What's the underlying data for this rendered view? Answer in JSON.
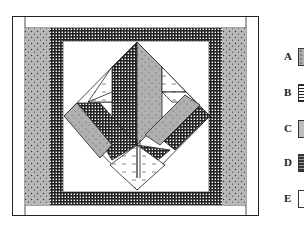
{
  "figure": {
    "legend": [
      {
        "label": "A",
        "fabric": "gray dotted"
      },
      {
        "label": "B",
        "fabric": "dark crosshatch"
      },
      {
        "label": "C",
        "fabric": "light gray speckled"
      },
      {
        "label": "D",
        "fabric": "dark horizontal stripes"
      },
      {
        "label": "E",
        "fabric": "white with dashes"
      }
    ]
  },
  "colors": {
    "dotted_gray": "#b4b4b4",
    "crosshatch": "#3a3a3a",
    "white": "#ffffff",
    "line": "#222222"
  }
}
